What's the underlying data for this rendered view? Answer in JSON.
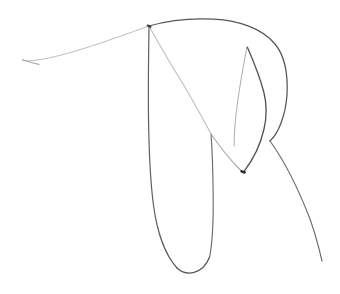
{
  "canvas": {
    "width": 340,
    "height": 294,
    "background_color": "#ffffff",
    "medium": "graphite-pencil-line-drawing",
    "subject": "abstract continuous contour sketch"
  },
  "palette": {
    "ink_dark": "#4a4a4f",
    "ink_mid": "#6f7076",
    "ink_light": "#a9aab0",
    "ink_faint": "#c9cace",
    "ink_ghost": "#e2e3e6",
    "accent_dot": "#2b2b30"
  },
  "anchors": {
    "tail_tip_left": [
      22,
      61
    ],
    "apex_junction": [
      149,
      26
    ],
    "arc_crest": [
      215,
      19
    ],
    "arc_right_extreme": [
      287,
      95
    ],
    "inner_peak": [
      247,
      47
    ],
    "v_vertex": [
      243,
      172
    ],
    "crossing_center": [
      270,
      141
    ],
    "crossing_upper": [
      211,
      134
    ],
    "u_loop_bottom": [
      185,
      273
    ],
    "tail_tip_bottom_right": [
      322,
      261
    ]
  },
  "strokes": [
    {
      "name": "left-tail-to-apex",
      "description": "faint long tapering line rising from far left edge up to the apex junction",
      "color": "#b8b9be",
      "width": 1.0,
      "opacity": 0.95,
      "d": "M22.5,60.5 C30,61.5 38,60 46,58.5 C70,54 104,42 128,33.5 C137,30.4 144,27.8 149,26"
    },
    {
      "name": "left-tail-hook",
      "description": "tiny hooked flick at the very start of the left tail",
      "color": "#9a9ba1",
      "width": 1.1,
      "opacity": 0.85,
      "d": "M22.5,59.8 C27,61.5 33,63.2 39,64.4"
    },
    {
      "name": "top-arc-over-to-right",
      "description": "dark upper arc from apex rising to crest then bowing right and down the right flank",
      "color": "#55565c",
      "width": 1.25,
      "opacity": 1,
      "d": "M149,26 C168,20.5 192,18 214,19.2 C238,20.6 262,28 275,44 C285,56 288,76 287,95 C285.5,116 278,134 270,141"
    },
    {
      "name": "right-flank-to-bottom-tail",
      "description": "continuation from the crossing down-right as a long fading tail to lower right",
      "color": "#6a6b71",
      "width": 1.15,
      "opacity": 1,
      "d": "M270,141 C283,159 298,188 310,219 C315,233 319,248 322,261"
    },
    {
      "name": "apex-down-long-u-left",
      "description": "dark near-vertical left side of the large U loop descending from the apex",
      "color": "#5d5e64",
      "width": 1.2,
      "opacity": 1,
      "d": "M149,27 C148.5,60 148,92 148.6,124 C149.2,156 150.4,183 153.6,206 C157,231 165,255 177,268"
    },
    {
      "name": "u-loop-bottom",
      "description": "rounded bottom of the large U loop",
      "color": "#55565c",
      "width": 1.3,
      "opacity": 1,
      "d": "M177,268 C182,272.6 188,274 194,272.4 C201,270.5 206.5,265 209.6,257"
    },
    {
      "name": "u-loop-right-rise",
      "description": "right side of the U loop rising up toward the faint diagonal crossing",
      "color": "#6a6b71",
      "width": 1.15,
      "opacity": 1,
      "d": "M209.6,257 C212.4,243 213.4,222 213.2,198 C213,174 212.4,152 211,134"
    },
    {
      "name": "diagonal-apex-to-crossing",
      "description": "faint diagonal from the apex junction sweeping down-right through the upper crossing",
      "color": "#bcbdc2",
      "width": 1.05,
      "opacity": 1,
      "d": "M149.5,27 C158,42 168,60 180,79 C190,95 200,114 206,124.5 C208.4,128.8 210,132 211,134"
    },
    {
      "name": "diagonal-crossing-to-v-vertex",
      "description": "faint continuation from the upper crossing down-right into the V vertex",
      "color": "#a8a9af",
      "width": 1.1,
      "opacity": 1,
      "d": "M211,134 C218,144 228,157 236.5,166 C239.4,169 241.6,171 243,172"
    },
    {
      "name": "inner-peak-left-limb",
      "description": "faint steep limb descending left from the inner sharp peak down to the V vertex region",
      "color": "#b0b1b7",
      "width": 1.05,
      "opacity": 1,
      "d": "M246.8,47.6 C244,62 240.4,82 237.6,102 C235.4,118 234,134 234.2,146"
    },
    {
      "name": "inner-peak-right-limb",
      "description": "dark limb from the inner peak bowing right then returning to the V vertex",
      "color": "#4f5056",
      "width": 1.3,
      "opacity": 1,
      "d": "M247.4,47.2 C253,60 259.6,76 263.8,92 C266.6,103 267,116 264,129 C260.4,145 252,161 244.4,170.8"
    },
    {
      "name": "v-vertex-dot",
      "description": "small dark blot where the strokes terminate at the V vertex",
      "color": "#2b2b30",
      "width": 2.6,
      "opacity": 1,
      "d": "M241.6,171.4 C242.4,171.8 243.4,172.2 244.6,172.4"
    },
    {
      "name": "apex-junction-blot",
      "description": "small dark knot where three strokes meet at the top apex",
      "color": "#3e3f45",
      "width": 2.2,
      "opacity": 1,
      "d": "M147.8,25.6 C148.6,25.8 149.6,26.2 150.4,26.8"
    }
  ]
}
